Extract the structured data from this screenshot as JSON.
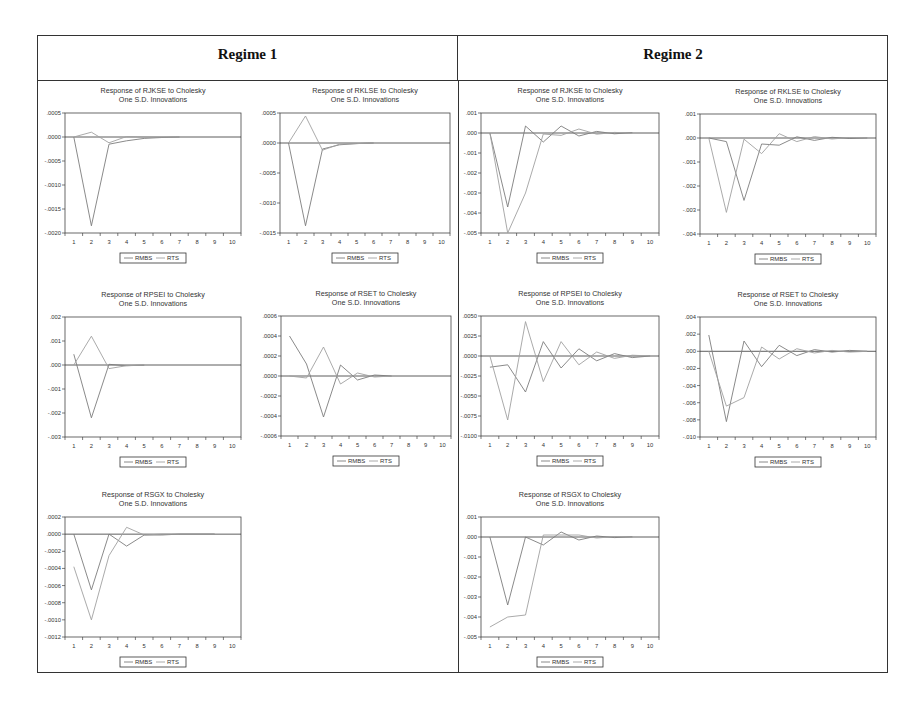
{
  "header": {
    "regime1": "Regime 1",
    "regime2": "Regime 2"
  },
  "colors": {
    "line": "#8a8a8a",
    "axis": "#444444",
    "zero": "#333333"
  },
  "legend": [
    "RMBS",
    "RTS"
  ],
  "chart_data": [
    {
      "id": "r1-rjkse",
      "regime": "Regime 1",
      "type": "line",
      "title": "Response of RJKSE to Cholesky",
      "subtitle": "One S.D. Innovations",
      "x": [
        1,
        2,
        3,
        4,
        5,
        6,
        7,
        8,
        9,
        10
      ],
      "ylim": [
        -0.002,
        0.0005
      ],
      "yticks": [
        0.0005,
        0.0,
        -0.0005,
        -0.001,
        -0.0015,
        -0.002
      ],
      "ytick_labels": [
        ".0005",
        ".0000",
        "-.0005",
        "-.0010",
        "-.0015",
        "-.0020"
      ],
      "series": [
        {
          "name": "RMBS",
          "values": [
            0.0,
            -0.00185,
            -0.00015,
            -8e-05,
            -3e-05,
            -1e-05,
            0.0,
            null,
            null,
            null
          ]
        },
        {
          "name": "RTS",
          "values": [
            0.0,
            0.0001,
            -0.00012,
            1e-05,
            0.0,
            0.0,
            0.0,
            null,
            null,
            null
          ]
        }
      ],
      "box": {
        "x": 65,
        "y": 113,
        "w": 176,
        "h": 120
      }
    },
    {
      "id": "r1-rklse",
      "regime": "Regime 1",
      "type": "line",
      "title": "Response of RKLSE to Cholesky",
      "subtitle": "One S.D. Innovations",
      "x": [
        1,
        2,
        3,
        4,
        5,
        6,
        7,
        8,
        9,
        10
      ],
      "ylim": [
        -0.0015,
        0.0005
      ],
      "yticks": [
        0.0005,
        0.0,
        -0.0005,
        -0.001,
        -0.0015
      ],
      "ytick_labels": [
        ".0005",
        ".0000",
        "-.0005",
        "-.0010",
        "-.0015"
      ],
      "series": [
        {
          "name": "RMBS",
          "values": [
            0.0,
            -0.00138,
            -0.0001,
            -3e-05,
            -1e-05,
            0.0,
            null,
            null,
            null,
            null
          ]
        },
        {
          "name": "RTS",
          "values": [
            0.0,
            0.00045,
            -0.00012,
            -2e-05,
            -1e-05,
            0.0,
            null,
            null,
            null,
            null
          ]
        }
      ],
      "box": {
        "x": 280,
        "y": 113,
        "w": 170,
        "h": 120
      }
    },
    {
      "id": "r2-rjkse",
      "regime": "Regime 2",
      "type": "line",
      "title": "Response of RJKSE to Cholesky",
      "subtitle": "One S.D. Innovations",
      "x": [
        1,
        2,
        3,
        4,
        5,
        6,
        7,
        8,
        9,
        10
      ],
      "ylim": [
        -0.005,
        0.001
      ],
      "yticks": [
        0.001,
        0.0,
        -0.001,
        -0.002,
        -0.003,
        -0.004,
        -0.005
      ],
      "ytick_labels": [
        ".001",
        ".000",
        "-.001",
        "-.002",
        "-.003",
        "-.004",
        "-.005"
      ],
      "series": [
        {
          "name": "RMBS",
          "values": [
            0.0,
            -0.0037,
            0.00035,
            -0.00045,
            0.00035,
            -0.00015,
            8e-05,
            -4e-05,
            2e-05,
            null
          ]
        },
        {
          "name": "RTS",
          "values": [
            0.0,
            -0.005,
            -0.003,
            -5e-05,
            -0.00012,
            0.0002,
            -6e-05,
            3e-05,
            -1e-05,
            null
          ]
        }
      ],
      "box": {
        "x": 481,
        "y": 113,
        "w": 178,
        "h": 120
      }
    },
    {
      "id": "r2-rklse",
      "regime": "Regime 2",
      "type": "line",
      "title": "Response of RKLSE to Cholesky",
      "subtitle": "One S.D. Innovations",
      "x": [
        1,
        2,
        3,
        4,
        5,
        6,
        7,
        8,
        9,
        10
      ],
      "ylim": [
        -0.004,
        0.001
      ],
      "yticks": [
        0.001,
        0.0,
        -0.001,
        -0.002,
        -0.003,
        -0.004
      ],
      "ytick_labels": [
        ".001",
        ".000",
        "-.001",
        "-.002",
        "-.003",
        "-.004"
      ],
      "series": [
        {
          "name": "RMBS",
          "values": [
            0.0,
            -0.00015,
            -0.0026,
            -0.00025,
            -0.0003,
            5e-05,
            -0.0001,
            3e-05,
            -2e-05,
            0.0
          ]
        },
        {
          "name": "RTS",
          "values": [
            0.0,
            -0.0031,
            -5e-05,
            -0.00065,
            0.00018,
            -0.00015,
            6e-05,
            -4e-05,
            2e-05,
            0.0
          ]
        }
      ],
      "box": {
        "x": 700,
        "y": 114,
        "w": 176,
        "h": 120
      }
    },
    {
      "id": "r1-rpsei",
      "regime": "Regime 1",
      "type": "line",
      "title": "Response of RPSEI to Cholesky",
      "subtitle": "One S.D. Innovations",
      "x": [
        1,
        2,
        3,
        4,
        5,
        6,
        7,
        8,
        9,
        10
      ],
      "ylim": [
        -0.003,
        0.002
      ],
      "yticks": [
        0.002,
        0.001,
        0.0,
        -0.001,
        -0.002,
        -0.003
      ],
      "ytick_labels": [
        ".002",
        ".001",
        ".000",
        "-.001",
        "-.002",
        "-.003"
      ],
      "series": [
        {
          "name": "RMBS",
          "values": [
            0.00045,
            -0.0022,
            3e-05,
            -3e-05,
            -1e-05,
            null,
            null,
            null,
            null,
            null
          ]
        },
        {
          "name": "RTS",
          "values": [
            0.0,
            0.0012,
            -0.00015,
            -3e-05,
            0.0,
            null,
            null,
            null,
            null,
            null
          ]
        }
      ],
      "box": {
        "x": 65,
        "y": 317,
        "w": 176,
        "h": 120
      }
    },
    {
      "id": "r1-rset",
      "regime": "Regime 1",
      "type": "line",
      "title": "Response of RSET to Cholesky",
      "subtitle": "One S.D. Innovations",
      "x": [
        1,
        2,
        3,
        4,
        5,
        6,
        7,
        8,
        9,
        10
      ],
      "ylim": [
        -0.0006,
        0.0006
      ],
      "yticks": [
        0.0006,
        0.0004,
        0.0002,
        0.0,
        -0.0002,
        -0.0004,
        -0.0006
      ],
      "ytick_labels": [
        ".0006",
        ".0004",
        ".0002",
        ".0000",
        "-.0002",
        "-.0004",
        "-.0006"
      ],
      "series": [
        {
          "name": "RMBS",
          "values": [
            0.0004,
            0.00012,
            -0.00041,
            0.00011,
            -4e-05,
            1e-05,
            0.0,
            null,
            null,
            null
          ]
        },
        {
          "name": "RTS",
          "values": [
            0.0,
            -2e-05,
            0.00029,
            -8e-05,
            3e-05,
            -1e-05,
            0.0,
            null,
            null,
            null
          ]
        }
      ],
      "box": {
        "x": 281,
        "y": 316,
        "w": 170,
        "h": 120
      }
    },
    {
      "id": "r2-rpsei",
      "regime": "Regime 2",
      "type": "line",
      "title": "Response of RPSEI to Cholesky",
      "subtitle": "One S.D. Innovations",
      "x": [
        1,
        2,
        3,
        4,
        5,
        6,
        7,
        8,
        9,
        10
      ],
      "ylim": [
        -0.01,
        0.005
      ],
      "yticks": [
        0.005,
        0.0025,
        0.0,
        -0.0025,
        -0.005,
        -0.0075,
        -0.01
      ],
      "ytick_labels": [
        ".0050",
        ".0025",
        ".0000",
        "-.0025",
        "-.0050",
        "-.0075",
        "-.0100"
      ],
      "series": [
        {
          "name": "RMBS",
          "values": [
            -0.0014,
            -0.0011,
            -0.0045,
            0.0018,
            -0.0015,
            0.0009,
            -0.0006,
            0.0003,
            -0.0002,
            0.0
          ]
        },
        {
          "name": "RTS",
          "values": [
            0.0,
            -0.008,
            0.0043,
            -0.0032,
            0.0018,
            -0.0011,
            0.0005,
            -0.0003,
            0.0001,
            0.0
          ]
        }
      ],
      "box": {
        "x": 481,
        "y": 316,
        "w": 178,
        "h": 120
      }
    },
    {
      "id": "r2-rset",
      "regime": "Regime 2",
      "type": "line",
      "title": "Response of RSET to Cholesky",
      "subtitle": "One S.D. Innovations",
      "x": [
        1,
        2,
        3,
        4,
        5,
        6,
        7,
        8,
        9,
        10
      ],
      "ylim": [
        -0.01,
        0.004
      ],
      "yticks": [
        0.004,
        0.002,
        0.0,
        -0.002,
        -0.004,
        -0.006,
        -0.008,
        -0.01
      ],
      "ytick_labels": [
        ".004",
        ".002",
        ".000",
        "-.002",
        "-.004",
        "-.006",
        "-.008",
        "-.010"
      ],
      "series": [
        {
          "name": "RMBS",
          "values": [
            0.0019,
            -0.0082,
            0.0012,
            -0.0018,
            0.0007,
            -0.0005,
            0.0002,
            -0.0001,
            0.0001,
            0.0
          ]
        },
        {
          "name": "RTS",
          "values": [
            0.0,
            -0.0064,
            -0.0054,
            0.0005,
            -0.0009,
            0.0003,
            -0.0002,
            0.0001,
            -0.0001,
            0.0
          ]
        }
      ],
      "box": {
        "x": 700,
        "y": 317,
        "w": 176,
        "h": 120
      }
    },
    {
      "id": "r1-rsgx",
      "regime": "Regime 1",
      "type": "line",
      "title": "Response of RSGX to Cholesky",
      "subtitle": "One S.D. Innovations",
      "x": [
        1,
        2,
        3,
        4,
        5,
        6,
        7,
        8,
        9,
        10
      ],
      "ylim": [
        -0.0012,
        0.0002
      ],
      "yticks": [
        0.0002,
        0.0,
        -0.0002,
        -0.0004,
        -0.0006,
        -0.0008,
        -0.001,
        -0.0012
      ],
      "ytick_labels": [
        ".0002",
        ".0000",
        "-.0002",
        "-.0004",
        "-.0006",
        "-.0008",
        "-.0010",
        "-.0012"
      ],
      "series": [
        {
          "name": "RMBS",
          "values": [
            0.0,
            -0.00065,
            0.0,
            -0.00014,
            -1e-05,
            -1e-05,
            0.0,
            0.0,
            0.0,
            null
          ]
        },
        {
          "name": "RTS",
          "values": [
            -0.00038,
            -0.001,
            -0.00025,
            8e-05,
            -1e-05,
            0.0,
            0.0,
            0.0,
            0.0,
            null
          ]
        }
      ],
      "box": {
        "x": 65,
        "y": 517,
        "w": 176,
        "h": 120
      }
    },
    {
      "id": "r2-rsgx",
      "regime": "Regime 2",
      "type": "line",
      "title": "Response of RSGX to Cholesky",
      "subtitle": "One S.D. Innovations",
      "x": [
        1,
        2,
        3,
        4,
        5,
        6,
        7,
        8,
        9,
        10
      ],
      "ylim": [
        -0.005,
        0.001
      ],
      "yticks": [
        0.001,
        0.0,
        -0.001,
        -0.002,
        -0.003,
        -0.004,
        -0.005
      ],
      "ytick_labels": [
        ".001",
        ".000",
        "-.001",
        "-.002",
        "-.003",
        "-.004",
        "-.005"
      ],
      "series": [
        {
          "name": "RMBS",
          "values": [
            0.0,
            -0.0034,
            0.0,
            -0.0004,
            0.00025,
            -0.00015,
            5e-05,
            -3e-05,
            1e-05,
            null
          ]
        },
        {
          "name": "RTS",
          "values": [
            -0.0045,
            -0.004,
            -0.0039,
            0.0001,
            0.0001,
            0.0001,
            -5e-05,
            2e-05,
            -1e-05,
            null
          ]
        }
      ],
      "box": {
        "x": 481,
        "y": 517,
        "w": 178,
        "h": 120
      }
    }
  ]
}
